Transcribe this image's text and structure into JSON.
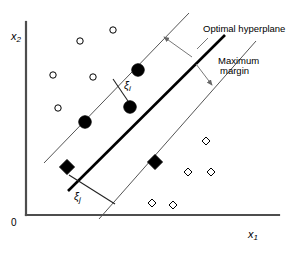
{
  "figure": {
    "title_semantic": "svm-optimal-hyperplane-soft-margin-diagram",
    "background_color": "#ffffff",
    "width": 289,
    "height": 258
  },
  "axes": {
    "x_label": "x",
    "x_label_sub": "1",
    "y_label": "x",
    "y_label_sub": "2",
    "origin_label": "0",
    "axis_color": "#4d4d4d",
    "x_axis": {
      "x1": 26,
      "y1": 215,
      "x2": 279,
      "y2": 215
    },
    "y_axis": {
      "x1": 26,
      "y1": 215,
      "x2": 26,
      "y2": 22
    }
  },
  "annotations": {
    "optimal_hyperplane": "Optimal hyperplane",
    "maximum_margin_line1": "Maximum",
    "maximum_margin_line2": "margin",
    "slack_i": "ξ",
    "slack_i_sub": "i",
    "slack_j": "ξ",
    "slack_j_sub": "j"
  },
  "chart_data": {
    "type": "scatter",
    "title": "",
    "xlabel": "x1",
    "ylabel": "x2",
    "grid": false,
    "legend": "none",
    "xlim": [
      0,
      289
    ],
    "ylim": [
      0,
      258
    ],
    "note": "Coordinates are in screenshot pixel space, y increases downward.",
    "series": [
      {
        "name": "class-a-open-circles",
        "marker": "open-circle",
        "color": "#000000",
        "fill": "none",
        "radius": 3.2,
        "points": [
          {
            "x": 80,
            "y": 41
          },
          {
            "x": 113,
            "y": 30
          },
          {
            "x": 53,
            "y": 75
          },
          {
            "x": 93,
            "y": 77
          },
          {
            "x": 58,
            "y": 108
          }
        ]
      },
      {
        "name": "class-a-support-vectors-filled-circles",
        "marker": "filled-circle",
        "color": "#000000",
        "fill": "#000000",
        "radius": 6.2,
        "points": [
          {
            "x": 138,
            "y": 70
          },
          {
            "x": 130,
            "y": 107
          },
          {
            "x": 85,
            "y": 122
          }
        ]
      },
      {
        "name": "class-b-open-diamonds",
        "marker": "open-diamond",
        "color": "#000000",
        "fill": "none",
        "radius": 4.0,
        "points": [
          {
            "x": 206,
            "y": 141
          },
          {
            "x": 188,
            "y": 172
          },
          {
            "x": 211,
            "y": 172
          },
          {
            "x": 152,
            "y": 203
          },
          {
            "x": 173,
            "y": 205
          }
        ]
      },
      {
        "name": "class-b-support-vectors-filled-diamonds",
        "marker": "filled-diamond",
        "color": "#000000",
        "fill": "#000000",
        "radius": 7.5,
        "points": [
          {
            "x": 67,
            "y": 167
          },
          {
            "x": 155,
            "y": 162
          }
        ]
      }
    ],
    "lines": [
      {
        "name": "optimal-hyperplane",
        "style": "solid-thick",
        "color": "#000000",
        "width": 2.6,
        "x1": 68,
        "y1": 191,
        "x2": 225,
        "y2": 35
      },
      {
        "name": "upper-margin-boundary",
        "style": "solid-thin",
        "color": "#555555",
        "width": 1.0,
        "x1": 44,
        "y1": 163,
        "x2": 189,
        "y2": 13
      },
      {
        "name": "lower-margin-boundary",
        "style": "solid-thin",
        "color": "#555555",
        "width": 1.0,
        "x1": 99,
        "y1": 219,
        "x2": 256,
        "y2": 41
      },
      {
        "name": "slack-i-connector",
        "style": "solid-thin",
        "color": "#333333",
        "width": 1.0,
        "x1": 113,
        "y1": 79,
        "x2": 130,
        "y2": 104
      },
      {
        "name": "slack-j-connector",
        "style": "solid-thin",
        "color": "#333333",
        "width": 1.0,
        "x1": 69,
        "y1": 175,
        "x2": 115,
        "y2": 204
      }
    ],
    "arrows": [
      {
        "name": "margin-arrow-upper",
        "color": "#777777",
        "x1": 192,
        "y1": 57,
        "x2": 163,
        "y2": 36
      },
      {
        "name": "margin-arrow-lower",
        "color": "#777777",
        "x1": 196,
        "y1": 64,
        "x2": 213,
        "y2": 86
      },
      {
        "name": "optimal-hyperplane-leader",
        "color": "#777777",
        "x1": 206,
        "y1": 40,
        "x2": 196,
        "y2": 50
      }
    ]
  }
}
